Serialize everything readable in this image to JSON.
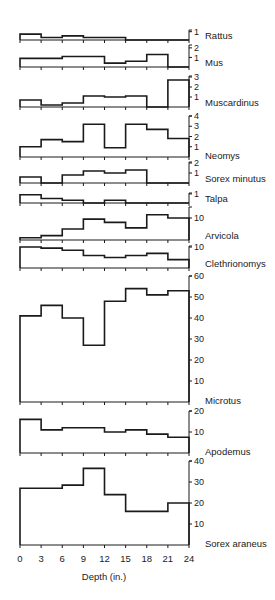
{
  "chart_data": {
    "type": "bar",
    "style": "stepped histograms (small multiples)",
    "xlabel": "Depth (in.)",
    "x_ticks": [
      0,
      3,
      6,
      9,
      12,
      15,
      18,
      21,
      24
    ],
    "x_bins": [
      "0-3",
      "3-6",
      "6-9",
      "9-12",
      "12-15",
      "15-18",
      "18-21",
      "21-24"
    ],
    "grid": false,
    "panels": [
      {
        "name": "Rattus",
        "yticks": [
          1
        ],
        "ymax": 1.2,
        "top": 30,
        "base": 40,
        "values": [
          0.7,
          0.3,
          0.5,
          0.3,
          0.3,
          0,
          0,
          0
        ]
      },
      {
        "name": "Mus",
        "yticks": [
          1,
          2
        ],
        "ymax": 2.3,
        "top": 45,
        "base": 67,
        "values": [
          0.9,
          0.9,
          1.1,
          1.1,
          0.4,
          0.6,
          1.3,
          0
        ]
      },
      {
        "name": "Muscardinus",
        "yticks": [
          1,
          2,
          3
        ],
        "ymax": 3.1,
        "top": 76,
        "base": 107,
        "values": [
          0.7,
          0.2,
          0.4,
          1.1,
          1.0,
          1.1,
          0,
          2.7
        ]
      },
      {
        "name": "Neomys",
        "yticks": [
          1,
          2,
          3,
          4
        ],
        "ymax": 4.0,
        "top": 116,
        "base": 157,
        "values": [
          1.0,
          1.7,
          1.5,
          3.2,
          0.9,
          3.2,
          2.7,
          1.8
        ]
      },
      {
        "name": "Sorex minutus",
        "yticks": [
          1,
          2
        ],
        "ymax": 2.1,
        "top": 162,
        "base": 183,
        "values": [
          0.6,
          0,
          0.8,
          1.2,
          1.0,
          1.3,
          0,
          0
        ]
      },
      {
        "name": "Talpa",
        "yticks": [
          1
        ],
        "ymax": 1.1,
        "top": 193,
        "base": 203,
        "values": [
          0.9,
          0.5,
          0.3,
          0,
          0.3,
          0,
          0,
          0
        ]
      },
      {
        "name": "Arvicola",
        "yticks": [
          10
        ],
        "ymax": 15,
        "top": 207,
        "base": 240,
        "values": [
          1,
          2,
          5,
          9.5,
          8,
          5.5,
          11.5,
          10
        ]
      },
      {
        "name": "Clethrionomys",
        "yticks": [
          10
        ],
        "ymax": 10.5,
        "top": 246,
        "base": 268,
        "values": [
          10,
          9.5,
          8.5,
          6,
          5,
          6,
          7,
          4
        ]
      },
      {
        "name": "Microtus",
        "yticks": [
          10,
          20,
          30,
          40,
          50,
          60
        ],
        "ymax": 60,
        "top": 276,
        "base": 402,
        "values": [
          41,
          46,
          40,
          27,
          48,
          54,
          51,
          53
        ]
      },
      {
        "name": "Apodemus",
        "yticks": [
          10,
          20
        ],
        "ymax": 20,
        "top": 411,
        "base": 453,
        "values": [
          16,
          11,
          12,
          12,
          10,
          11,
          9,
          7.5
        ]
      },
      {
        "name": "Sorex araneus",
        "yticks": [
          10,
          20,
          30,
          40
        ],
        "ymax": 40,
        "top": 461,
        "base": 545,
        "values": [
          27,
          27,
          28.5,
          36.5,
          24,
          16,
          16,
          20
        ]
      }
    ]
  }
}
